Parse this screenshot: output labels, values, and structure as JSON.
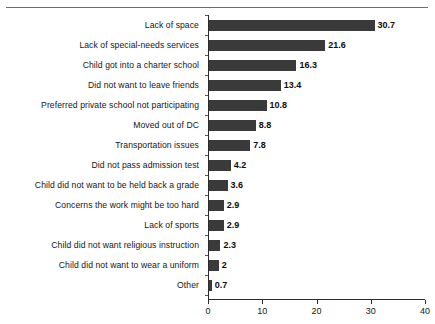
{
  "chart_data": {
    "type": "bar",
    "orientation": "horizontal",
    "title": "",
    "subtitle": "",
    "xlabel": "",
    "ylabel": "",
    "xlim": [
      0,
      40
    ],
    "xticks": [
      0,
      10,
      20,
      30,
      40
    ],
    "grid": false,
    "legend": null,
    "bar_color": "#3a3a3a",
    "value_labels": true,
    "categories": [
      "Lack of space",
      "Lack of special-needs services",
      "Child got into a charter school",
      "Did not want to leave friends",
      "Preferred private school not participating",
      "Moved out of DC",
      "Transportation issues",
      "Did not pass admission test",
      "Child did not want to be held back a grade",
      "Concerns the work might be too hard",
      "Lack of sports",
      "Child did not want religious instruction",
      "Child did not want to wear a uniform",
      "Other"
    ],
    "values": [
      30.7,
      21.6,
      16.3,
      13.4,
      10.8,
      8.8,
      7.8,
      4.2,
      3.6,
      2.9,
      2.9,
      2.3,
      2,
      0.7
    ],
    "value_text": [
      "30.7",
      "21.6",
      "16.3",
      "13.4",
      "10.8",
      "8.8",
      "7.8",
      "4.2",
      "3.6",
      "2.9",
      "2.9",
      "2.3",
      "2",
      "0.7"
    ],
    "xtick_text": [
      "0",
      "10",
      "20",
      "30",
      "40"
    ]
  }
}
